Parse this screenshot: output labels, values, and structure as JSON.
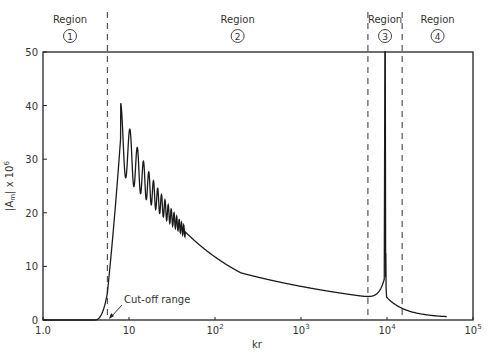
{
  "chart_data": {
    "type": "line",
    "title": "",
    "xlabel": "kr",
    "ylabel": "|Am| x 10^6",
    "ylabel_parts": {
      "main": "|A",
      "sub": "m",
      "tail": "| x 10",
      "sup": "6"
    },
    "xscale": "log",
    "xlim": [
      1.0,
      100000
    ],
    "ylim": [
      0,
      50
    ],
    "grid": false,
    "legend": null,
    "y_ticks": [
      0,
      10,
      20,
      30,
      40,
      50
    ],
    "x_ticks": [
      {
        "value": 1,
        "label": "1.0",
        "sup": ""
      },
      {
        "value": 10,
        "label": "10",
        "sup": ""
      },
      {
        "value": 100,
        "label": "10",
        "sup": "2"
      },
      {
        "value": 1000,
        "label": "10",
        "sup": "3"
      },
      {
        "value": 10000,
        "label": "10",
        "sup": "4"
      },
      {
        "value": 100000,
        "label": "10",
        "sup": "5"
      }
    ],
    "region_boundaries_kr": [
      5.6,
      6000,
      15000
    ],
    "regions": [
      {
        "label": "Region",
        "number": "1"
      },
      {
        "label": "Region",
        "number": "2"
      },
      {
        "label": "Region",
        "number": "3"
      },
      {
        "label": "Region",
        "number": "4"
      }
    ],
    "annotations": [
      {
        "text": "Cut-off range",
        "at_kr": 5.8,
        "at_y": 0
      }
    ],
    "series": [
      {
        "name": "|Am|",
        "x": [
          1,
          4,
          4.8,
          5.3,
          5.6,
          6,
          7,
          8,
          9,
          10,
          11,
          12,
          13,
          14,
          15,
          17,
          20,
          25,
          30,
          40,
          60,
          100,
          200,
          400,
          1000,
          2000,
          4000,
          6000,
          8000,
          9000,
          9400,
          9600,
          10000,
          12000,
          15000,
          20000,
          30000,
          50000
        ],
        "values": [
          0,
          0,
          0.3,
          1.5,
          5,
          13,
          27,
          36.5,
          30,
          34,
          25,
          31,
          24,
          28,
          22,
          24,
          21,
          19,
          17,
          15,
          12.5,
          10,
          7.3,
          5.3,
          3.7,
          3.0,
          2.5,
          2.9,
          4.5,
          8,
          50,
          12,
          4,
          2.2,
          1.5,
          1.0,
          0.6,
          0.3
        ]
      }
    ],
    "peak_features": [
      {
        "description": "first oscillation maximum",
        "kr": 8,
        "value": 36.8
      },
      {
        "description": "resonance spike off scale",
        "kr": 9500,
        "value": 50
      },
      {
        "description": "secondary spike",
        "kr": 9700,
        "value": 12.5
      }
    ]
  }
}
